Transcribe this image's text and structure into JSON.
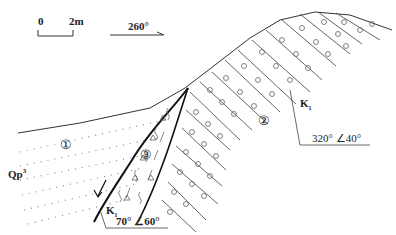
{
  "scale_bar": {
    "start_label": "0",
    "end_label": "2m"
  },
  "direction_arrow": {
    "label": "260°"
  },
  "units": [
    {
      "id": "1",
      "label": "①",
      "symbol": "Qp",
      "symbol_sup": "3"
    },
    {
      "id": "2",
      "label": "②",
      "symbol": "K",
      "symbol_sub": "1"
    },
    {
      "id": "3",
      "label": "③"
    }
  ],
  "attitudes": [
    {
      "label": "320° ∠40°",
      "formation": "K",
      "formation_sub": "1"
    },
    {
      "label": "70° ∠60°",
      "formation": "K",
      "formation_sub": "1"
    }
  ],
  "colors": {
    "line": "#333333",
    "fault": "#111111",
    "pattern": "#666666"
  }
}
